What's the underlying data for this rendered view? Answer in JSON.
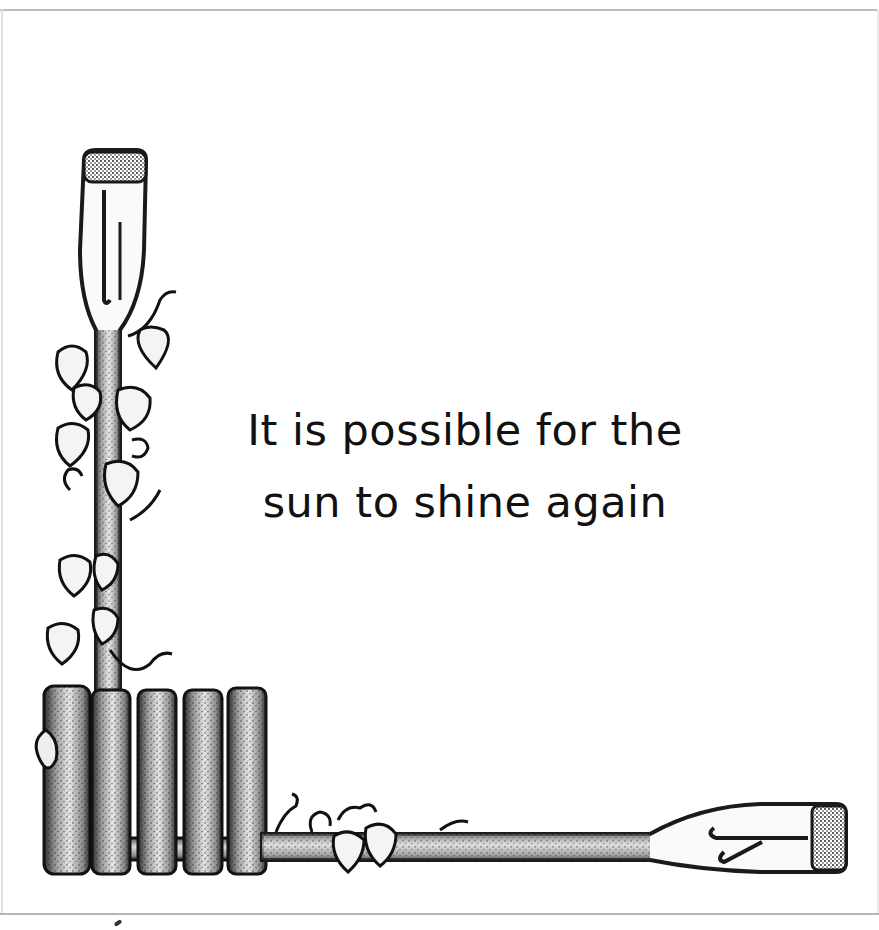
{
  "card": {
    "quote_lines": [
      "It is possible for the",
      "sun to shine again"
    ]
  },
  "illustration": {
    "elements": [
      "vertical-oar",
      "ivy-vine",
      "picket-fence",
      "horizontal-oar"
    ],
    "ink_color": "#1a1a1a",
    "paper_color": "#ffffff"
  }
}
